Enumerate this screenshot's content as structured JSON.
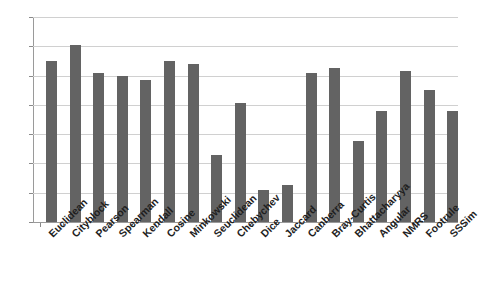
{
  "chart_data": {
    "type": "bar",
    "title": "",
    "xlabel": "",
    "ylabel": "",
    "ylim": [
      0,
      14
    ],
    "ytick_step": 2,
    "yticks": [
      0,
      2,
      4,
      6,
      8,
      10,
      12,
      14
    ],
    "grid": true,
    "legend": null,
    "bar_color": "#636363",
    "gridline_color": "#d0d0d0",
    "axis_color": "#9a9a9a",
    "background_color": "#ffffff",
    "categories": [
      "Euclidean",
      "Cityblock",
      "Pearson",
      "Spearman",
      "Kendall",
      "Cosine",
      "Minkowski",
      "Seuclidean",
      "Chebychev",
      "Dice",
      "Jaccard",
      "Canberra",
      "Bray-Curtis",
      "Bhattacharyya",
      "Angular",
      "NMRS",
      "Footrule",
      "SSSim"
    ],
    "values": [
      11.0,
      12.1,
      10.15,
      10.0,
      9.7,
      11.0,
      10.8,
      4.6,
      8.1,
      2.2,
      2.5,
      10.2,
      10.5,
      5.5,
      7.6,
      10.3,
      9.0,
      7.6
    ]
  }
}
